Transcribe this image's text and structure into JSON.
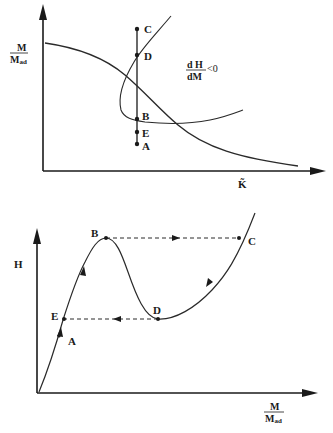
{
  "top_diagram": {
    "y_axis_label": {
      "numerator": "M",
      "denominator": "M",
      "denominator_sub": "ad"
    },
    "x_axis_label": "K̃",
    "annotation": {
      "numerator": "d H",
      "denominator": "dM",
      "relation": "<0"
    },
    "points": [
      {
        "label": "C"
      },
      {
        "label": "D"
      },
      {
        "label": "B"
      },
      {
        "label": "E"
      },
      {
        "label": "A"
      }
    ]
  },
  "bottom_diagram": {
    "y_axis_label": "H",
    "x_axis_label": {
      "numerator": "M",
      "denominator": "M",
      "denominator_sub": "ad"
    },
    "points": [
      {
        "label": "B"
      },
      {
        "label": "C"
      },
      {
        "label": "D"
      },
      {
        "label": "E"
      },
      {
        "label": "A"
      }
    ]
  },
  "colors": {
    "ink": "#1a1a1a",
    "line": "#333333",
    "background": "#ffffff"
  }
}
